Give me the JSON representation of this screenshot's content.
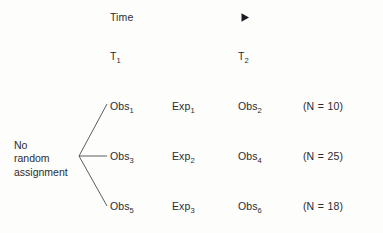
{
  "diagram": {
    "background_color": "#fdfdfc",
    "text_color": "#2b2b30",
    "time_axis": {
      "label": "Time",
      "arrow_start_color": "#c8a59a",
      "arrow_mid_color": "#8e9bb4",
      "arrow_end_color": "#2f3a66",
      "arrowhead_color": "#1b1b22"
    },
    "time_points": [
      {
        "base": "T",
        "sub": "1"
      },
      {
        "base": "T",
        "sub": "2"
      }
    ],
    "group_label": "No\nrandom\nassignment",
    "branch_line_color": "#4a4a52",
    "rows": [
      {
        "pretest": {
          "base": "Obs",
          "sub": "1"
        },
        "treatment": {
          "base": "Exp",
          "sub": "1"
        },
        "posttest": {
          "base": "Obs",
          "sub": "2"
        },
        "n_open": "(N",
        "n_eq": "=",
        "n_value": "10)"
      },
      {
        "pretest": {
          "base": "Obs",
          "sub": "3"
        },
        "treatment": {
          "base": "Exp",
          "sub": "2"
        },
        "posttest": {
          "base": "Obs",
          "sub": "4"
        },
        "n_open": "(N",
        "n_eq": "=",
        "n_value": "25)"
      },
      {
        "pretest": {
          "base": "Obs",
          "sub": "5"
        },
        "treatment": {
          "base": "Exp",
          "sub": "3"
        },
        "posttest": {
          "base": "Obs",
          "sub": "6"
        },
        "n_open": "(N",
        "n_eq": "=",
        "n_value": "18)"
      }
    ]
  }
}
